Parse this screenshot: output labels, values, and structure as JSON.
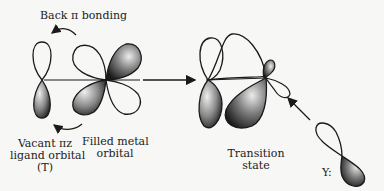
{
  "diagram": {
    "labels": {
      "back_bonding": "Back π bonding",
      "vacant_line1": "Vacant πz",
      "vacant_line2": "ligand orbital",
      "vacant_line3": "(T)",
      "filled_line1": "Filled metal",
      "filled_line2": "orbital",
      "transition_line1": "Transition",
      "transition_line2": "state",
      "nucleophile": "Y:"
    },
    "components": [
      "vacant-pi-ligand-orbital",
      "filled-metal-d-orbital",
      "reaction-arrow",
      "transition-state-orbitals",
      "incoming-nucleophile-orbital"
    ],
    "colors": {
      "background": "#f7f7f5",
      "outline": "#1a1a1a",
      "shade_dark": "#2a2a2a",
      "shade_light": "#e6e6e6"
    }
  }
}
